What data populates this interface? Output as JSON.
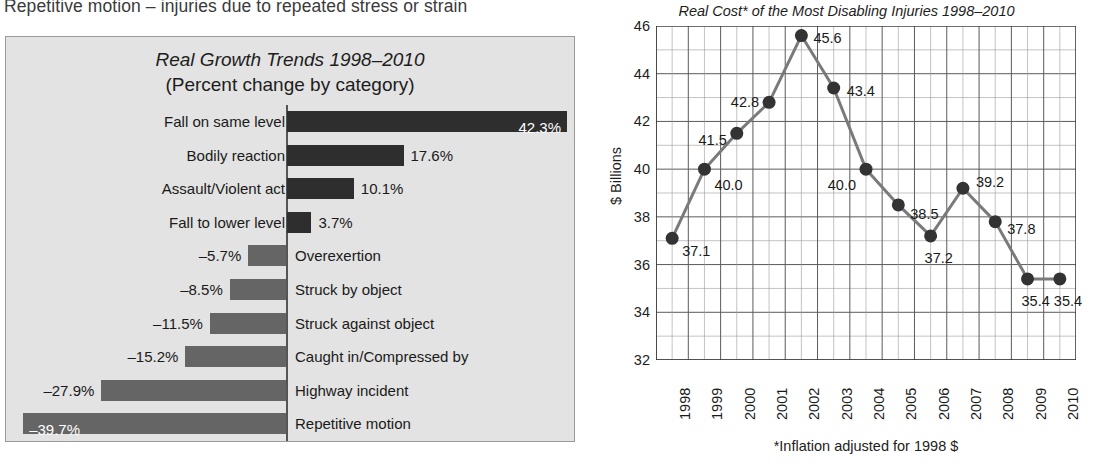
{
  "top_text": "Repetitive motion – injuries due to repeated stress or strain",
  "bar_panel": {
    "title": "Real Growth Trends 1998–2010",
    "subtitle": "(Percent change by category)"
  },
  "line_panel": {
    "title": "Real Cost* of the Most Disabling Injuries 1998–2010",
    "ylabel": "$ Billions",
    "footnote": "*Inflation adjusted for 1998 $"
  },
  "colors": {
    "panel_bg": "#e3e3e3",
    "bar_positive": "#2e2e2e",
    "bar_negative": "#656565",
    "line": "#7a7a7a",
    "marker": "#333333",
    "grid": "#5a5a5a"
  },
  "chart_data": [
    {
      "type": "bar",
      "title": "Real Growth Trends 1998–2010",
      "subtitle": "(Percent change by category)",
      "xlabel": "",
      "ylabel": "",
      "orientation": "horizontal",
      "grid": false,
      "legend": "none",
      "xlim": [
        -39.7,
        42.3
      ],
      "categories": [
        "Fall on same level",
        "Bodily reaction",
        "Assault/Violent act",
        "Fall to lower level",
        "Overexertion",
        "Struck by object",
        "Struck against object",
        "Caught in/Compressed by",
        "Highway incident",
        "Repetitive motion"
      ],
      "values": [
        42.3,
        17.6,
        10.1,
        3.7,
        -5.7,
        -8.5,
        -11.5,
        -15.2,
        -27.9,
        -39.7
      ],
      "value_labels": [
        "42.3%",
        "17.6%",
        "10.1%",
        "3.7%",
        "–5.7%",
        "–8.5%",
        "–11.5%",
        "–15.2%",
        "–27.9%",
        "–39.7%"
      ]
    },
    {
      "type": "line",
      "title": "Real Cost* of the Most Disabling Injuries 1998–2010",
      "xlabel": "",
      "ylabel": "$ Billions",
      "footnote": "*Inflation adjusted for 1998 $",
      "grid": true,
      "legend": "none",
      "ylim": [
        32,
        46
      ],
      "ytick_labels": [
        "46",
        "44",
        "42",
        "40",
        "38",
        "36",
        "34",
        "32"
      ],
      "yticks": [
        46,
        44,
        42,
        40,
        38,
        36,
        34,
        32
      ],
      "x": [
        "1998",
        "1999",
        "2000",
        "2001",
        "2002",
        "2003",
        "2004",
        "2005",
        "2006",
        "2007",
        "2008",
        "2009",
        "2010"
      ],
      "values": [
        37.1,
        40.0,
        41.5,
        42.8,
        45.6,
        43.4,
        40.0,
        38.5,
        37.2,
        39.2,
        37.8,
        35.4,
        35.4
      ],
      "point_labels": [
        "37.1",
        "40.0",
        "41.5",
        "42.8",
        "45.6",
        "43.4",
        "40.0",
        "38.5",
        "37.2",
        "39.2",
        "37.8",
        "35.4",
        "35.4"
      ]
    }
  ]
}
